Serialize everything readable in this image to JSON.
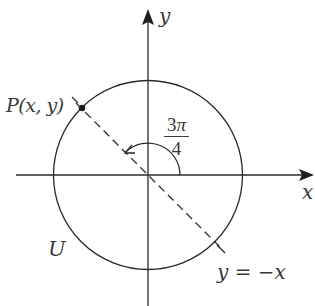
{
  "diagram": {
    "colors": {
      "stroke": "#2a2a2a",
      "text": "#3a3a3a",
      "background": "#ffffff"
    },
    "axes": {
      "x_label": "x",
      "y_label": "y"
    },
    "circle": {
      "label": "U"
    },
    "point": {
      "label": "P(x, y)"
    },
    "line": {
      "label": "y = −x",
      "style": "dashed"
    },
    "angle": {
      "numerator": "3",
      "numerator_symbol": "π",
      "denominator": "4"
    }
  }
}
